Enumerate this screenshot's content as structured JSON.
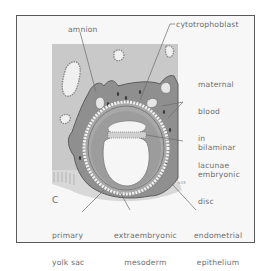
{
  "figure": {
    "panel_letter": "C",
    "scale_note": "x45",
    "labels": {
      "amnion": "amnion",
      "cytotrophoblast": "cytotrophoblast",
      "maternal_blood": [
        "maternal",
        "blood",
        "in",
        "lacunae"
      ],
      "bilaminar_disc": [
        "bilaminar",
        "embryonic",
        "disc"
      ],
      "primary_yolk_sac": [
        "primary",
        "yolk sac"
      ],
      "extraembryonic_mesoderm": [
        "extraembryonic",
        "mesoderm"
      ],
      "endometrial_epithelium": [
        "endometrial",
        "epithelium"
      ]
    },
    "colors": {
      "background": "#f7f7f7",
      "endometrium": "#c4c4c4",
      "syncytiotrophoblast": "#8e8e8e",
      "lacuna": "#e9e9e9",
      "label_text": "#6e6e6e",
      "border": "#5a5a5a"
    }
  }
}
